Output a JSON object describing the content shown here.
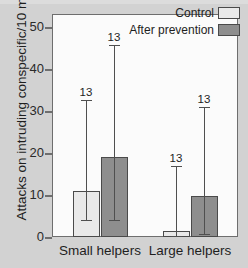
{
  "chart_data": {
    "type": "bar",
    "title": "",
    "xlabel": "",
    "ylabel": "Attacks on intruding conspecific/10 min",
    "categories": [
      "Small helpers",
      "Large helpers"
    ],
    "ylim": [
      0,
      53
    ],
    "yticks": [
      0,
      10,
      20,
      30,
      40,
      50
    ],
    "ytick_labels": [
      "0",
      "10",
      "20",
      "30",
      "40",
      "50"
    ],
    "grid": false,
    "legend_position": "top-right",
    "series": [
      {
        "name": "Control",
        "color": "#e9e9e9",
        "values": [
          11.0,
          1.5
        ],
        "err_low": [
          4.1,
          0.2
        ],
        "err_high": [
          32.6,
          17.0
        ],
        "n_labels": [
          "13",
          "13"
        ]
      },
      {
        "name": "After prevention",
        "color": "#8e8e8e",
        "values": [
          19.0,
          9.8
        ],
        "err_low": [
          4.1,
          0.8
        ],
        "err_high": [
          45.7,
          31.0
        ],
        "n_labels": [
          "13",
          "13"
        ]
      }
    ],
    "annotations": [
      {
        "text": "13",
        "series": "Control",
        "category": "Small helpers"
      },
      {
        "text": "13",
        "series": "After prevention",
        "category": "Small helpers"
      },
      {
        "text": "13",
        "series": "Control",
        "category": "Large helpers"
      },
      {
        "text": "13",
        "series": "After prevention",
        "category": "Large helpers"
      }
    ]
  },
  "legend": {
    "items": [
      {
        "label": "Control",
        "color": "#e9e9e9"
      },
      {
        "label": "After prevention",
        "color": "#8e8e8e"
      }
    ]
  },
  "axes": {
    "y_title": "Attacks on intruding conspecific/10 min",
    "y_tick_labels": [
      "50",
      "40",
      "30",
      "20",
      "10",
      "0"
    ],
    "x_tick_labels": [
      "Small helpers",
      "Large helpers"
    ]
  },
  "colors": {
    "background": "#d2d2d2",
    "plot_background": "#fbfbfb",
    "frame": "#6e6e6e",
    "control_fill": "#e9e9e9",
    "prevention_fill": "#8e8e8e",
    "text": "#1e1e1e"
  }
}
